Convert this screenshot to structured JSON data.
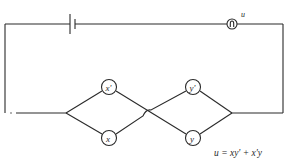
{
  "diagram": {
    "type": "switching-circuit",
    "components": {
      "battery": {
        "label": ""
      },
      "lamp": {
        "label": "u"
      },
      "switches": [
        {
          "id": "x_prime",
          "label": "x'",
          "position": "upper-left"
        },
        {
          "id": "x",
          "label": "x",
          "position": "lower-left"
        },
        {
          "id": "y_prime",
          "label": "y'",
          "position": "upper-right"
        },
        {
          "id": "y",
          "label": "y",
          "position": "lower-right"
        }
      ]
    },
    "equation": "u = xy' + x'y",
    "colors": {
      "line": "#2a2a2a",
      "background": "#ffffff"
    }
  }
}
